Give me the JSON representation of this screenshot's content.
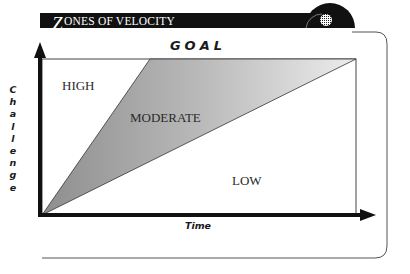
{
  "header": {
    "title_initial": "Z",
    "title_rest": "ONES OF VELOCITY"
  },
  "diagram": {
    "goal_label": "GOAL",
    "y_axis_label": "Challenge",
    "x_axis_label": "Time",
    "zones": [
      {
        "id": "high",
        "label": "HIGH",
        "fill": "#ffffff"
      },
      {
        "id": "moderate",
        "label": "MODERATE",
        "fill_gradient": [
          "#9a9a9a",
          "#e6e6e6"
        ]
      },
      {
        "id": "low",
        "label": "LOW",
        "fill": "#ffffff"
      }
    ],
    "colors": {
      "header_bar": "#111111",
      "axis": "#111111",
      "frame": "#555555"
    }
  }
}
